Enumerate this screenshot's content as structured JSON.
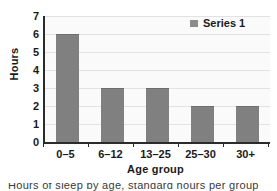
{
  "chart_data": {
    "type": "bar",
    "title": "",
    "categories": [
      "0–5",
      "6–12",
      "13–25",
      "25–30",
      "30+"
    ],
    "values": [
      6,
      3,
      3,
      2,
      2
    ],
    "series": [
      {
        "name": "Series 1",
        "values": [
          6,
          3,
          3,
          2,
          2
        ]
      }
    ],
    "xlabel": "Age group",
    "ylabel": "Hours",
    "ylim": [
      0,
      7
    ],
    "ytick_step": 1,
    "yticks": [
      "7",
      "6",
      "5",
      "4",
      "3",
      "2",
      "1",
      "0"
    ],
    "grid": "horizontal",
    "legend_position": "top-right",
    "bar_color": "#808080",
    "plot_background": "#fafafa",
    "gridline_color": "#e2e2e2",
    "axis_color": "#2b2b2b"
  },
  "legend": {
    "entries": [
      {
        "label": "Series 1",
        "color": "#8c8c8c"
      }
    ]
  },
  "caption": {
    "text": "Hours of sleep by age, standard hours per group"
  }
}
